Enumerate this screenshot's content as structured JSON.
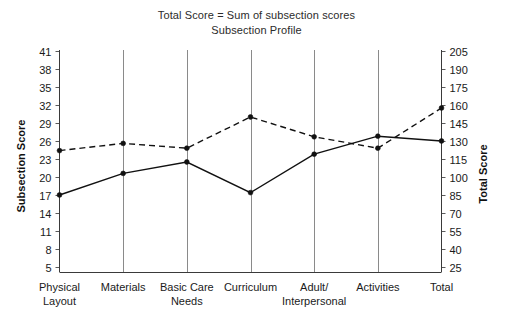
{
  "chart_data": {
    "type": "line",
    "title": "Subsection Profile",
    "subtitle": "Total Score = Sum of subsection scores",
    "xlabel": "",
    "ylabel": "Subsection Score",
    "y2label": "Total Score",
    "grid": true,
    "legend_position": "none",
    "categories": [
      "Physical Layout",
      "Materials",
      "Basic Care Needs",
      "Curriculum",
      "Adult/ Interpersonal",
      "Activities",
      "Total"
    ],
    "category_lines": [
      [
        "Physical",
        "Layout"
      ],
      [
        "Materials",
        ""
      ],
      [
        "Basic Care",
        "Needs"
      ],
      [
        "Curriculum",
        ""
      ],
      [
        "Adult/",
        "Interpersonal"
      ],
      [
        "Activities",
        ""
      ],
      [
        "Total",
        ""
      ]
    ],
    "ylim": [
      5,
      41
    ],
    "yticks": [
      41,
      38,
      35,
      32,
      29,
      26,
      23,
      20,
      17,
      14,
      11,
      8,
      5
    ],
    "y2lim": [
      25,
      205
    ],
    "y2ticks": [
      205,
      190,
      175,
      160,
      145,
      130,
      115,
      100,
      85,
      70,
      55,
      40,
      25
    ],
    "series": [
      {
        "name": "Dashed series",
        "style": "dashed",
        "color": "#111111",
        "values": [
          24.4,
          25.6,
          24.8,
          30.0,
          26.7,
          24.8,
          31.5
        ]
      },
      {
        "name": "Solid series",
        "style": "solid",
        "color": "#111111",
        "values": [
          17.0,
          20.6,
          22.5,
          17.4,
          23.8,
          26.8,
          26.0
        ]
      }
    ]
  }
}
